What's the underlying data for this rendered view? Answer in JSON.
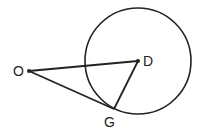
{
  "diagram": {
    "type": "geometry",
    "circle": {
      "center_label": "D",
      "cx": 138,
      "cy": 61,
      "r": 53
    },
    "points": {
      "O": {
        "label": "O",
        "x": 29,
        "y": 71
      },
      "D": {
        "label": "D",
        "x": 138,
        "y": 61
      },
      "G": {
        "label": "G",
        "x": 114,
        "y": 109
      }
    },
    "segments": [
      "OD",
      "OG",
      "DG"
    ],
    "stroke_color": "#222222"
  }
}
